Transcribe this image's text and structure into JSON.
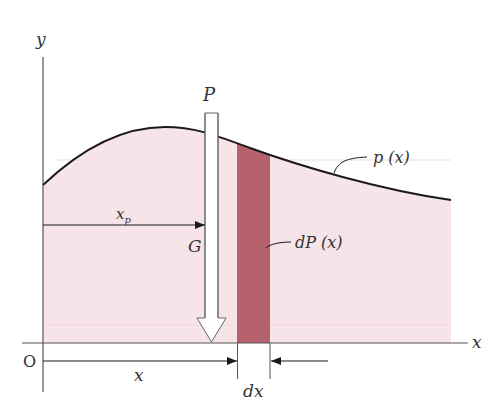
{
  "diagram": {
    "colors": {
      "background": "#ffffff",
      "load_fill": "#f6e4e8",
      "strip_fill": "#b5626d",
      "curve": "#1a1a1a",
      "axis": "#555555",
      "arrow_fill": "#ffffff"
    },
    "axes": {
      "y_label": "y",
      "x_label": "x",
      "origin_label": "O"
    },
    "load_curve": {
      "label": "p (x)",
      "points": [
        [
          43,
          185
        ],
        [
          100,
          140
        ],
        [
          160,
          127
        ],
        [
          210,
          133
        ],
        [
          250,
          148
        ],
        [
          330,
          175
        ],
        [
          451,
          200
        ]
      ]
    },
    "resultant": {
      "label": "P",
      "point_label": "G",
      "distance_label": "x",
      "distance_subscript": "p"
    },
    "element": {
      "label": "dP (x)",
      "width_label": "dx",
      "position_label": "x"
    }
  }
}
